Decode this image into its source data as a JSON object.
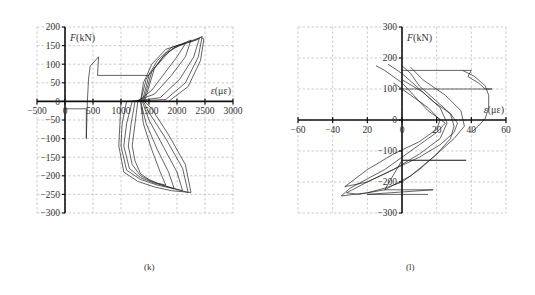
{
  "captions": {
    "left": "(k)",
    "right": "(l)"
  },
  "chart_data": [
    {
      "type": "line",
      "panel": "(k)",
      "title": "",
      "xlabel": "ε(με)",
      "ylabel": "F(kN)",
      "xlim": [
        -500,
        3000
      ],
      "ylim": [
        -300,
        200
      ],
      "xticks": [
        -500,
        0,
        500,
        1000,
        1500,
        2000,
        2500,
        3000
      ],
      "yticks": [
        200,
        150,
        100,
        50,
        0,
        -50,
        -100,
        -150,
        -200,
        -250,
        -300
      ],
      "grid": true,
      "legend": "none",
      "description": "Hysteretic load-strain curves; early elastic branch near 400 με up to ~120 kN, then loops spreading from ~1000 to ~2450 με peaking near 175 kN and troughs near -245 kN",
      "series": [
        {
          "name": "initial branch",
          "points": [
            [
              0,
              -20
            ],
            [
              380,
              -20
            ],
            [
              380,
              -100
            ],
            [
              400,
              0
            ],
            [
              420,
              60
            ],
            [
              450,
              95
            ],
            [
              600,
              120
            ],
            [
              580,
              70
            ],
            [
              1500,
              70
            ]
          ]
        },
        {
          "name": "loop 1",
          "points": [
            [
              1300,
              0
            ],
            [
              1250,
              -60
            ],
            [
              1200,
              -120
            ],
            [
              1250,
              -160
            ],
            [
              1350,
              -195
            ],
            [
              1500,
              -210
            ],
            [
              1650,
              -220
            ],
            [
              1800,
              -225
            ],
            [
              1700,
              -190
            ],
            [
              1550,
              -130
            ],
            [
              1400,
              -60
            ],
            [
              1350,
              0
            ],
            [
              1400,
              50
            ],
            [
              1550,
              100
            ],
            [
              1800,
              140
            ],
            [
              2000,
              150
            ],
            [
              2150,
              155
            ],
            [
              2000,
              120
            ],
            [
              1800,
              80
            ],
            [
              1550,
              30
            ],
            [
              1300,
              0
            ]
          ]
        },
        {
          "name": "loop 2",
          "points": [
            [
              1250,
              0
            ],
            [
              1180,
              -60
            ],
            [
              1130,
              -120
            ],
            [
              1200,
              -170
            ],
            [
              1350,
              -200
            ],
            [
              1550,
              -215
            ],
            [
              1750,
              -225
            ],
            [
              1950,
              -235
            ],
            [
              1850,
              -190
            ],
            [
              1650,
              -130
            ],
            [
              1450,
              -60
            ],
            [
              1350,
              0
            ],
            [
              1450,
              60
            ],
            [
              1650,
              110
            ],
            [
              1900,
              145
            ],
            [
              2100,
              155
            ],
            [
              2250,
              165
            ],
            [
              2150,
              120
            ],
            [
              1900,
              70
            ],
            [
              1600,
              20
            ],
            [
              1250,
              0
            ]
          ]
        },
        {
          "name": "loop 3",
          "points": [
            [
              1200,
              0
            ],
            [
              1100,
              -60
            ],
            [
              1050,
              -120
            ],
            [
              1150,
              -180
            ],
            [
              1350,
              -205
            ],
            [
              1600,
              -220
            ],
            [
              1850,
              -230
            ],
            [
              2100,
              -240
            ],
            [
              2000,
              -190
            ],
            [
              1750,
              -120
            ],
            [
              1500,
              -50
            ],
            [
              1380,
              0
            ],
            [
              1500,
              70
            ],
            [
              1750,
              120
            ],
            [
              2000,
              150
            ],
            [
              2250,
              160
            ],
            [
              2400,
              170
            ],
            [
              2300,
              120
            ],
            [
              2050,
              60
            ],
            [
              1700,
              10
            ],
            [
              1200,
              0
            ]
          ]
        },
        {
          "name": "loop 4",
          "points": [
            [
              1100,
              0
            ],
            [
              1020,
              -60
            ],
            [
              1000,
              -120
            ],
            [
              1100,
              -185
            ],
            [
              1350,
              -210
            ],
            [
              1650,
              -225
            ],
            [
              1950,
              -235
            ],
            [
              2200,
              -245
            ],
            [
              2100,
              -180
            ],
            [
              1800,
              -100
            ],
            [
              1500,
              -30
            ],
            [
              1400,
              0
            ],
            [
              1550,
              80
            ],
            [
              1800,
              130
            ],
            [
              2100,
              155
            ],
            [
              2350,
              165
            ],
            [
              2450,
              175
            ],
            [
              2380,
              120
            ],
            [
              2150,
              50
            ],
            [
              1800,
              5
            ],
            [
              1100,
              0
            ]
          ]
        },
        {
          "name": "loop 5",
          "points": [
            [
              1000,
              0
            ],
            [
              980,
              -60
            ],
            [
              960,
              -120
            ],
            [
              1050,
              -190
            ],
            [
              1300,
              -215
            ],
            [
              1600,
              -230
            ],
            [
              1900,
              -240
            ],
            [
              2250,
              -245
            ],
            [
              2150,
              -170
            ],
            [
              1850,
              -90
            ],
            [
              1550,
              -20
            ],
            [
              1420,
              0
            ],
            [
              1600,
              90
            ],
            [
              1900,
              140
            ],
            [
              2200,
              160
            ],
            [
              2420,
              172
            ],
            [
              2480,
              168
            ],
            [
              2420,
              110
            ],
            [
              2200,
              40
            ],
            [
              1850,
              0
            ],
            [
              1000,
              0
            ]
          ]
        }
      ]
    },
    {
      "type": "line",
      "panel": "(l)",
      "title": "",
      "xlabel": "ε(με)",
      "ylabel": "F(kN)",
      "xlim": [
        -60,
        60
      ],
      "ylim": [
        -300,
        300
      ],
      "xticks": [
        -60,
        -40,
        -20,
        0,
        20,
        40,
        60
      ],
      "xtick_labels": [
        "-60",
        "-40",
        "20",
        "0",
        "20",
        "40",
        "60"
      ],
      "yticks": [
        300,
        200,
        100,
        0,
        -100,
        -200,
        -300
      ],
      "grid": true,
      "legend": "none",
      "description": "Noisy hysteretic load-strain loops concentrated between -35 and 50 με; horizontal jumps at ~160 kN (to 40 με), ~100 kN (to 52 με), ~-130 kN (to 37 με) and ~-225 kN",
      "series": [
        {
          "name": "upper jumps",
          "points": [
            [
              0,
              160
            ],
            [
              40,
              160
            ],
            [
              38,
              140
            ],
            [
              44,
              120
            ],
            [
              48,
              100
            ],
            [
              52,
              100
            ],
            [
              0,
              100
            ]
          ]
        },
        {
          "name": "outer envelope",
          "points": [
            [
              35,
              160
            ],
            [
              42,
              140
            ],
            [
              48,
              110
            ],
            [
              50,
              80
            ],
            [
              50,
              40
            ],
            [
              48,
              5
            ],
            [
              44,
              -20
            ],
            [
              40,
              -40
            ]
          ]
        },
        {
          "name": "loop a",
          "points": [
            [
              -15,
              175
            ],
            [
              -10,
              160
            ],
            [
              -5,
              140
            ],
            [
              0,
              120
            ],
            [
              5,
              90
            ],
            [
              10,
              60
            ],
            [
              15,
              30
            ],
            [
              20,
              10
            ],
            [
              25,
              -10
            ],
            [
              20,
              -40
            ],
            [
              10,
              -80
            ],
            [
              0,
              -120
            ],
            [
              -10,
              -160
            ],
            [
              -20,
              -190
            ],
            [
              -30,
              -220
            ],
            [
              -35,
              -245
            ],
            [
              -20,
              -235
            ],
            [
              -10,
              -220
            ],
            [
              0,
              -200
            ],
            [
              10,
              -160
            ],
            [
              20,
              -110
            ],
            [
              28,
              -60
            ],
            [
              30,
              -20
            ],
            [
              28,
              20
            ],
            [
              20,
              60
            ],
            [
              10,
              110
            ],
            [
              5,
              150
            ],
            [
              0,
              175
            ]
          ]
        },
        {
          "name": "loop b",
          "points": [
            [
              -8,
              180
            ],
            [
              0,
              150
            ],
            [
              8,
              110
            ],
            [
              18,
              60
            ],
            [
              28,
              20
            ],
            [
              32,
              -10
            ],
            [
              30,
              -40
            ],
            [
              22,
              -80
            ],
            [
              10,
              -120
            ],
            [
              -5,
              -160
            ],
            [
              -20,
              -200
            ],
            [
              -32,
              -235
            ],
            [
              -25,
              -240
            ],
            [
              -10,
              -225
            ],
            [
              5,
              -180
            ],
            [
              18,
              -120
            ],
            [
              30,
              -60
            ],
            [
              36,
              -20
            ],
            [
              34,
              30
            ],
            [
              25,
              80
            ],
            [
              12,
              130
            ],
            [
              5,
              170
            ]
          ]
        },
        {
          "name": "lower jumps",
          "points": [
            [
              0,
              -130
            ],
            [
              37,
              -130
            ],
            [
              0,
              -130
            ],
            [
              -10,
              -225
            ],
            [
              18,
              -225
            ],
            [
              -20,
              -240
            ],
            [
              15,
              -240
            ]
          ]
        },
        {
          "name": "loop c",
          "points": [
            [
              -5,
              120
            ],
            [
              5,
              80
            ],
            [
              15,
              40
            ],
            [
              22,
              0
            ],
            [
              20,
              -30
            ],
            [
              10,
              -70
            ],
            [
              -5,
              -110
            ],
            [
              -20,
              -160
            ],
            [
              -33,
              -215
            ],
            [
              -20,
              -200
            ],
            [
              -5,
              -160
            ],
            [
              10,
              -110
            ],
            [
              22,
              -60
            ],
            [
              26,
              -10
            ],
            [
              22,
              40
            ],
            [
              12,
              90
            ],
            [
              0,
              130
            ]
          ]
        }
      ]
    }
  ]
}
